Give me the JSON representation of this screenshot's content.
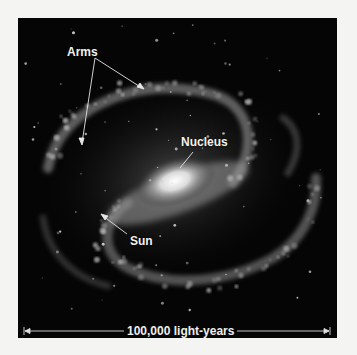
{
  "figure": {
    "labels": {
      "arms": "Arms",
      "nucleus": "Nucleus",
      "sun": "Sun"
    },
    "scale_bar": {
      "text": "100,000 light-years"
    },
    "colors": {
      "background": "#050505",
      "page": "#f4f4f2",
      "label": "#f2f2f2",
      "core": "#ffffff"
    }
  }
}
